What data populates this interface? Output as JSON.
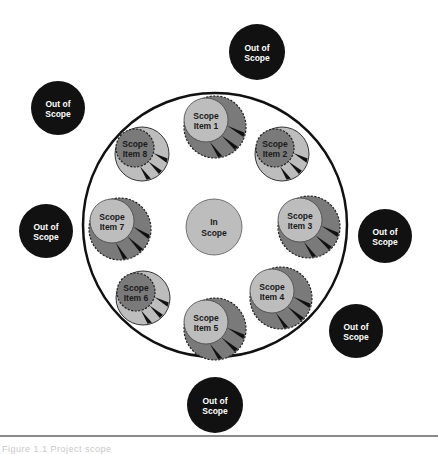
{
  "diagram": {
    "colors": {
      "boundary_stroke": "#111111",
      "in_scope_fill": "#bdbdbd",
      "light_fill": "#bdbdbd",
      "dark_fill": "#7a7a7a",
      "slice_fill": "#111111",
      "out_of_scope_fill": "#111111",
      "out_of_scope_text": "#ffffff"
    },
    "boundary": {
      "cx": 215,
      "cy": 225,
      "r": 132
    },
    "in_scope": {
      "label_line1": "In",
      "label_line2": "Scope",
      "cx": 214,
      "cy": 227,
      "r": 28
    },
    "scope_items": [
      {
        "id": 1,
        "label_line1": "Scope",
        "label_line2": "Item 1",
        "style": "light-inner",
        "outer": {
          "cx": 215,
          "cy": 127,
          "r": 31
        },
        "inner": {
          "cx": 206,
          "cy": 120,
          "r": 22
        }
      },
      {
        "id": 2,
        "label_line1": "Scope",
        "label_line2": "Item 2",
        "style": "dark-inner",
        "outer": {
          "cx": 282,
          "cy": 154,
          "r": 27
        },
        "inner": {
          "cx": 275,
          "cy": 148,
          "r": 19
        }
      },
      {
        "id": 3,
        "label_line1": "Scope",
        "label_line2": "Item 3",
        "style": "light-inner",
        "outer": {
          "cx": 309,
          "cy": 227,
          "r": 31
        },
        "inner": {
          "cx": 300,
          "cy": 220,
          "r": 22
        }
      },
      {
        "id": 4,
        "label_line1": "Scope",
        "label_line2": "Item 4",
        "style": "light-inner",
        "outer": {
          "cx": 281,
          "cy": 298,
          "r": 31
        },
        "inner": {
          "cx": 272,
          "cy": 291,
          "r": 22
        }
      },
      {
        "id": 5,
        "label_line1": "Scope",
        "label_line2": "Item 5",
        "style": "light-inner",
        "outer": {
          "cx": 215,
          "cy": 329,
          "r": 31
        },
        "inner": {
          "cx": 206,
          "cy": 322,
          "r": 22
        }
      },
      {
        "id": 6,
        "label_line1": "Scope",
        "label_line2": "Item 6",
        "style": "dark-inner",
        "outer": {
          "cx": 143,
          "cy": 298,
          "r": 27
        },
        "inner": {
          "cx": 136,
          "cy": 292,
          "r": 19
        }
      },
      {
        "id": 7,
        "label_line1": "Scope",
        "label_line2": "Item 7",
        "style": "light-inner",
        "outer": {
          "cx": 120,
          "cy": 229,
          "r": 31
        },
        "inner": {
          "cx": 112,
          "cy": 221,
          "r": 22
        }
      },
      {
        "id": 8,
        "label_line1": "Scope",
        "label_line2": "Item 8",
        "style": "dark-inner",
        "outer": {
          "cx": 142,
          "cy": 154,
          "r": 27
        },
        "inner": {
          "cx": 135,
          "cy": 148,
          "r": 19
        }
      }
    ],
    "out_of_scope": [
      {
        "position": "top",
        "label_line1": "Out of",
        "label_line2": "Scope",
        "cx": 257,
        "cy": 52,
        "r": 28
      },
      {
        "position": "upper-left",
        "label_line1": "Out of",
        "label_line2": "Scope",
        "cx": 58,
        "cy": 108,
        "r": 27
      },
      {
        "position": "left",
        "label_line1": "Out of",
        "label_line2": "Scope",
        "cx": 46,
        "cy": 231,
        "r": 27
      },
      {
        "position": "right",
        "label_line1": "Out of",
        "label_line2": "Scope",
        "cx": 385,
        "cy": 236,
        "r": 27
      },
      {
        "position": "lower-right",
        "label_line1": "Out of",
        "label_line2": "Scope",
        "cx": 356,
        "cy": 331,
        "r": 27
      },
      {
        "position": "bottom",
        "label_line1": "Out of",
        "label_line2": "Scope",
        "cx": 215,
        "cy": 405,
        "r": 28
      }
    ]
  },
  "caption": {
    "text": "Figure 1.1  Project scope"
  }
}
